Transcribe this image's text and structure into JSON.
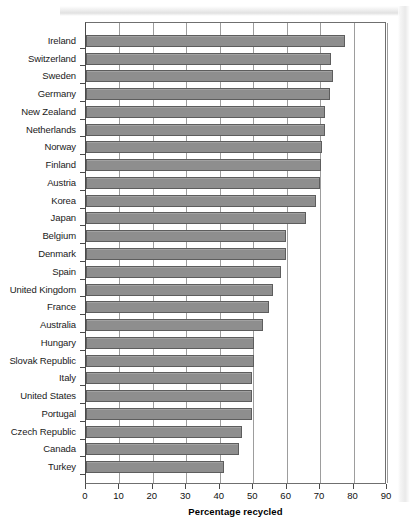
{
  "figure": {
    "partial_header_text": "",
    "background_color": "#ffffff",
    "bar_fill_color": "#8e8e8e",
    "bar_edge_color": "#5d5d5d",
    "grid_color": "#9d9d9d",
    "axis_color": "#4a4a4a"
  },
  "chart_data": {
    "type": "bar",
    "orientation": "horizontal",
    "title": "",
    "xlabel": "Percentage recycled",
    "ylabel": "",
    "xlim": [
      0,
      90
    ],
    "xticks": [
      0,
      10,
      20,
      30,
      40,
      50,
      60,
      70,
      80,
      90
    ],
    "xtick_labels": [
      "0",
      "10",
      "20",
      "30",
      "40",
      "50",
      "60",
      "70",
      "80",
      "90"
    ],
    "grid": true,
    "grid_axis": "x",
    "legend": null,
    "categories": [
      "Ireland",
      "Switzerland",
      "Sweden",
      "Germany",
      "New Zealand",
      "Netherlands",
      "Norway",
      "Finland",
      "Austria",
      "Korea",
      "Japan",
      "Belgium",
      "Denmark",
      "Spain",
      "United Kingdom",
      "France",
      "Australia",
      "Hungary",
      "Slovak Republic",
      "Italy",
      "United States",
      "Portugal",
      "Czech Republic",
      "Canada",
      "Turkey"
    ],
    "values": [
      77.3,
      73.4,
      73.9,
      73.1,
      71.6,
      71.4,
      70.7,
      70.4,
      69.9,
      68.7,
      65.9,
      59.9,
      59.9,
      58.4,
      55.9,
      54.7,
      52.9,
      50.1,
      50.1,
      49.7,
      49.7,
      49.7,
      46.6,
      45.6,
      41.2
    ]
  }
}
